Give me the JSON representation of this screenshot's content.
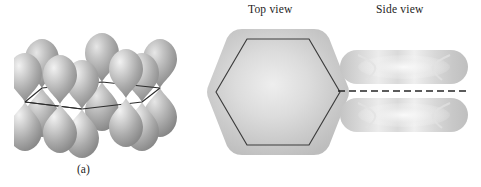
{
  "figure": {
    "background_color": "#ffffff",
    "width": 481,
    "height": 187
  },
  "panel_a": {
    "caption": "(a)",
    "description": "Six unhybridized 2p orbitals on the carbon atoms of the benzene ring",
    "orbital_count": 6,
    "lobes_per_orbital": 2,
    "ring_outline_color": "#2a2a2a",
    "lobe_fill_light": "#e9e9e9",
    "lobe_fill_mid": "#b9b9b9",
    "lobe_fill_dark": "#8d8d8d",
    "ring_sites": [
      {
        "index": 1,
        "x": 22,
        "y": 62,
        "depth": "front-left"
      },
      {
        "index": 2,
        "x": 40,
        "y": 46,
        "depth": "back-left"
      },
      {
        "index": 3,
        "x": 86,
        "y": 40,
        "depth": "back-center"
      },
      {
        "index": 4,
        "x": 120,
        "y": 48,
        "depth": "back-right"
      },
      {
        "index": 5,
        "x": 136,
        "y": 62,
        "depth": "front-right"
      },
      {
        "index": 6,
        "x": 74,
        "y": 70,
        "depth": "front-center"
      }
    ]
  },
  "panel_b": {
    "caption": "(b)",
    "description": "Delocalized pi molecular orbital cloud of benzene",
    "top_view": {
      "label": "Top view",
      "shape": "hexagonal cloud with inner hexagon ring outline",
      "cloud_color": "#c6c6c6",
      "ring_outline_color": "#3a3a3a"
    },
    "side_view": {
      "label": "Side view",
      "shape": "two flattened lobes above and below the molecular plane",
      "lobe_color": "#c9c9c9",
      "nodal_plane": {
        "style": "dashed",
        "color": "#262626",
        "dash": "7 4"
      }
    }
  }
}
